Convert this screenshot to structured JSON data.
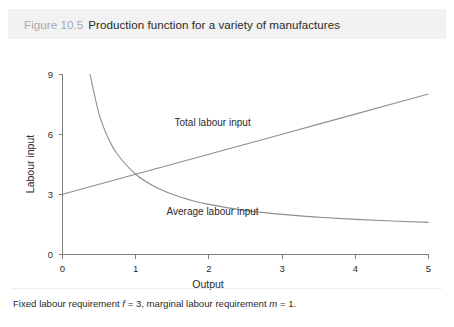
{
  "figure": {
    "number_label": "Figure 10.5",
    "title": "Production function for a variety of manufactures",
    "footnote_prefix": "Fixed labour requirement ",
    "footnote_symbol_f": "f",
    "footnote_mid": " = 3, marginal labour requirement ",
    "footnote_symbol_m": "m",
    "footnote_suffix": " = 1."
  },
  "colors": {
    "header_band": "#f2f2f2",
    "figure_number": "#a8a8a8",
    "title_text": "#2b2b2b",
    "axis": "#7d7d7d",
    "curve": "#8e8e8e",
    "background": "#ffffff"
  },
  "chart_data": {
    "type": "line",
    "title": "Production function for a variety of manufactures",
    "xlabel": "Output",
    "ylabel": "Labour input",
    "xlim": [
      0,
      5
    ],
    "ylim": [
      0,
      9
    ],
    "xticks": [
      "0",
      "1",
      "2",
      "3",
      "4",
      "5"
    ],
    "xtick_values": [
      0,
      1,
      2,
      3,
      4,
      5
    ],
    "yticks": [
      "0",
      "3",
      "6",
      "9"
    ],
    "ytick_values": [
      0,
      3,
      6,
      9
    ],
    "grid": false,
    "legend": "inline-annotations",
    "parameters": {
      "fixed_labour_requirement_f": 3,
      "marginal_labour_requirement_m": 1
    },
    "series": [
      {
        "name": "Total labour input",
        "formula": "L = f + m*q = 3 + q",
        "label_text": "Total labour input",
        "label_x": 2.05,
        "label_y": 6.4,
        "x": [
          0,
          0.5,
          1,
          1.5,
          2,
          2.5,
          3,
          3.5,
          4,
          4.5,
          5
        ],
        "values": [
          3,
          3.5,
          4,
          4.5,
          5,
          5.5,
          6,
          6.5,
          7,
          7.5,
          8
        ]
      },
      {
        "name": "Average labour input",
        "formula": "L/q = f/q + m = 3/q + 1",
        "label_text": "Average labour input",
        "label_x": 2.05,
        "label_y": 1.95,
        "x": [
          0.375,
          0.5,
          0.625,
          0.75,
          1,
          1.25,
          1.5,
          1.75,
          2,
          2.5,
          3,
          3.5,
          4,
          4.5,
          5
        ],
        "values": [
          9,
          7,
          5.8,
          5,
          4,
          3.4,
          3,
          2.71,
          2.5,
          2.2,
          2,
          1.86,
          1.75,
          1.67,
          1.6
        ]
      }
    ]
  }
}
